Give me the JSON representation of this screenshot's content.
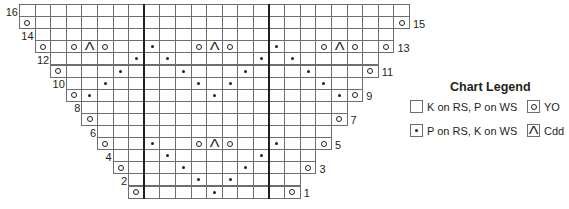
{
  "chart": {
    "columns": 25,
    "bold_column_lines": [
      8,
      16
    ],
    "rows": [
      {
        "num": 16,
        "start": 0,
        "end": 24,
        "label_side": "left",
        "stitches": {}
      },
      {
        "num": 15,
        "start": 0,
        "end": 24,
        "label_side": "right",
        "stitches": {
          "0": "yo",
          "24": "yo"
        }
      },
      {
        "num": 14,
        "start": 1,
        "end": 23,
        "label_side": "left",
        "stitches": {}
      },
      {
        "num": 13,
        "start": 1,
        "end": 23,
        "label_side": "right",
        "stitches": {
          "1": "yo",
          "3": "yo",
          "4": "cdd",
          "5": "yo",
          "8": "dot",
          "11": "yo",
          "12": "cdd",
          "13": "yo",
          "16": "dot",
          "19": "yo",
          "20": "cdd",
          "21": "yo",
          "23": "yo"
        }
      },
      {
        "num": 12,
        "start": 2,
        "end": 22,
        "label_side": "left",
        "stitches": {
          "7": "dot",
          "9": "dot",
          "15": "dot",
          "17": "dot"
        }
      },
      {
        "num": 11,
        "start": 2,
        "end": 22,
        "label_side": "right",
        "stitches": {
          "2": "yo",
          "6": "dot",
          "10": "dot",
          "14": "dot",
          "18": "dot",
          "22": "yo"
        }
      },
      {
        "num": 10,
        "start": 3,
        "end": 21,
        "label_side": "left",
        "stitches": {
          "5": "dot",
          "11": "dot",
          "13": "dot",
          "19": "dot"
        }
      },
      {
        "num": 9,
        "start": 3,
        "end": 21,
        "label_side": "right",
        "stitches": {
          "3": "yo",
          "4": "dot",
          "12": "dot",
          "20": "dot",
          "21": "yo"
        }
      },
      {
        "num": 8,
        "start": 4,
        "end": 20,
        "label_side": "left",
        "stitches": {}
      },
      {
        "num": 7,
        "start": 4,
        "end": 20,
        "label_side": "right",
        "stitches": {
          "4": "yo",
          "20": "yo"
        }
      },
      {
        "num": 6,
        "start": 5,
        "end": 19,
        "label_side": "left",
        "stitches": {}
      },
      {
        "num": 5,
        "start": 5,
        "end": 19,
        "label_side": "right",
        "stitches": {
          "5": "yo",
          "8": "dot",
          "11": "yo",
          "12": "cdd",
          "13": "yo",
          "16": "dot",
          "19": "yo"
        }
      },
      {
        "num": 4,
        "start": 6,
        "end": 18,
        "label_side": "left",
        "stitches": {
          "9": "dot",
          "15": "dot"
        }
      },
      {
        "num": 3,
        "start": 6,
        "end": 18,
        "label_side": "right",
        "stitches": {
          "6": "yo",
          "10": "dot",
          "14": "dot",
          "18": "yo"
        }
      },
      {
        "num": 2,
        "start": 7,
        "end": 17,
        "label_side": "left",
        "stitches": {
          "11": "dot",
          "13": "dot"
        }
      },
      {
        "num": 1,
        "start": 7,
        "end": 17,
        "label_side": "right",
        "stitches": {
          "7": "yo",
          "12": "dot",
          "17": "yo"
        }
      }
    ]
  },
  "legend": {
    "title": "Chart Legend",
    "items": [
      {
        "symbol": "blank",
        "label": "K on RS, P on WS"
      },
      {
        "symbol": "yo",
        "label": "YO"
      },
      {
        "symbol": "dot",
        "label": "P on RS, K on WS"
      },
      {
        "symbol": "cdd",
        "label": "Cdd"
      }
    ]
  },
  "symbols": {
    "yo": "open-circle",
    "dot": "small-dot",
    "cdd": "caret-up",
    "blank": "empty-square",
    "cdd_glyph": "Λ"
  }
}
